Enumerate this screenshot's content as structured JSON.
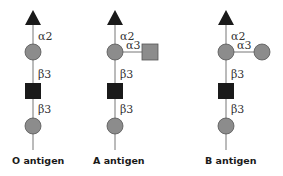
{
  "colors": {
    "fucose": "#1a1a1a",
    "galactose": "#8c8c8c",
    "glcnac": "#1a1a1a",
    "galnac": "#8c8c8c",
    "stem": "#777777"
  },
  "antigens": [
    {
      "label": "O antigen",
      "links": [
        "α2",
        "β3",
        "β3"
      ],
      "branch": null
    },
    {
      "label": "A antigen",
      "links": [
        "α2",
        "β3",
        "β3"
      ],
      "branch": {
        "link": "α3",
        "shape": "square"
      }
    },
    {
      "label": "B antigen",
      "links": [
        "α2",
        "β3",
        "β3"
      ],
      "branch": {
        "link": "α3",
        "shape": "circle"
      }
    }
  ]
}
